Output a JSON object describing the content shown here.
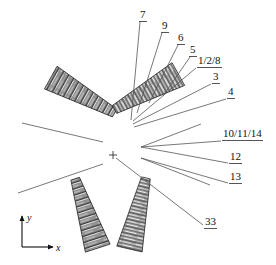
{
  "figure": {
    "type": "technical-line-diagram",
    "background_color": "#ffffff",
    "line_color": "#555555",
    "text_color": "#111111",
    "center_marker": {
      "name": "center-cross",
      "x": 113,
      "y": 155
    }
  },
  "callouts": [
    {
      "id": "c7",
      "label": "7",
      "text_x": 139,
      "text_y": 9,
      "underline_x2": 153,
      "leader": [
        [
          140,
          22
        ],
        [
          131,
          120
        ]
      ]
    },
    {
      "id": "c9",
      "label": "9",
      "text_x": 161,
      "text_y": 20,
      "underline_x2": 172,
      "leader": [
        [
          162,
          33
        ],
        [
          137,
          113
        ]
      ]
    },
    {
      "id": "c6",
      "label": "6",
      "text_x": 177,
      "text_y": 32,
      "underline_x2": 188,
      "leader": [
        [
          178,
          45
        ],
        [
          149,
          103
        ]
      ]
    },
    {
      "id": "c5",
      "label": "5",
      "text_x": 189,
      "text_y": 44,
      "underline_x2": 200,
      "leader": [
        [
          190,
          57
        ],
        [
          163,
          96
        ]
      ]
    },
    {
      "id": "c128",
      "label": "1/2/8",
      "text_x": 197,
      "text_y": 55,
      "underline_x2": 231,
      "leader": [
        [
          196,
          68
        ],
        [
          133,
          121
        ]
      ]
    },
    {
      "id": "c3",
      "label": "3",
      "text_x": 212,
      "text_y": 71,
      "underline_x2": 223,
      "leader": [
        [
          211,
          84
        ],
        [
          133,
          124
        ]
      ]
    },
    {
      "id": "c4",
      "label": "4",
      "text_x": 227,
      "text_y": 86,
      "underline_x2": 238,
      "leader": [
        [
          226,
          99
        ],
        [
          134,
          127
        ]
      ]
    },
    {
      "id": "c101114",
      "label": "10/11/14",
      "text_x": 222,
      "text_y": 128,
      "underline_x2": 271,
      "leader": [
        [
          221,
          141
        ],
        [
          141,
          147
        ]
      ]
    },
    {
      "id": "c12",
      "label": "12",
      "text_x": 229,
      "text_y": 151,
      "underline_x2": 246,
      "leader": [
        [
          228,
          163
        ],
        [
          141,
          147
        ]
      ]
    },
    {
      "id": "c13",
      "label": "13",
      "text_x": 229,
      "text_y": 171,
      "underline_x2": 246,
      "leader": [
        [
          228,
          183
        ],
        [
          141,
          158
        ]
      ]
    },
    {
      "id": "c33",
      "label": "33",
      "text_x": 204,
      "text_y": 216,
      "underline_x2": 221,
      "leader": [
        [
          203,
          225
        ],
        [
          116,
          158
        ]
      ]
    }
  ],
  "wedges": [
    {
      "name": "wedge-upper-left",
      "tip_x": 104,
      "tip_y": 131,
      "wide_x": 64,
      "wide_y": 60,
      "tip_w": 9,
      "wide_w": 26,
      "angle_deg": 229
    },
    {
      "name": "wedge-upper-right",
      "tip_x": 129,
      "tip_y": 125,
      "wide_x": 161,
      "wide_y": 57,
      "tip_w": 9,
      "wide_w": 26,
      "angle_deg": 295
    },
    {
      "name": "wedge-lower-left",
      "tip_x": 100,
      "tip_y": 177,
      "wide_x": 72,
      "wide_y": 248,
      "tip_w": 9,
      "wide_w": 26,
      "angle_deg": 112
    },
    {
      "name": "wedge-lower-right",
      "tip_x": 126,
      "tip_y": 177,
      "wide_x": 150,
      "wide_y": 248,
      "tip_w": 9,
      "wide_w": 26,
      "angle_deg": 68
    }
  ],
  "plain_leaders": [
    {
      "name": "plain-leader-upper-left",
      "points": [
        [
          22,
          123
        ],
        [
          103,
          142
        ]
      ]
    },
    {
      "name": "plain-leader-lower-left",
      "points": [
        [
          18,
          193
        ],
        [
          103,
          164
        ]
      ]
    },
    {
      "name": "plain-leader-right-upper",
      "points": [
        [
          201,
          124
        ],
        [
          141,
          147
        ]
      ]
    },
    {
      "name": "plain-leader-right-lower",
      "points": [
        [
          210,
          185
        ],
        [
          141,
          158
        ]
      ]
    }
  ],
  "axis_indicator": {
    "name": "xy-axis-indicator",
    "origin_x": 22,
    "origin_y": 247,
    "y_tip_x": 22,
    "y_tip_y": 214,
    "x_tip_x": 55,
    "x_tip_y": 247,
    "x_label": "x",
    "y_label": "y"
  }
}
